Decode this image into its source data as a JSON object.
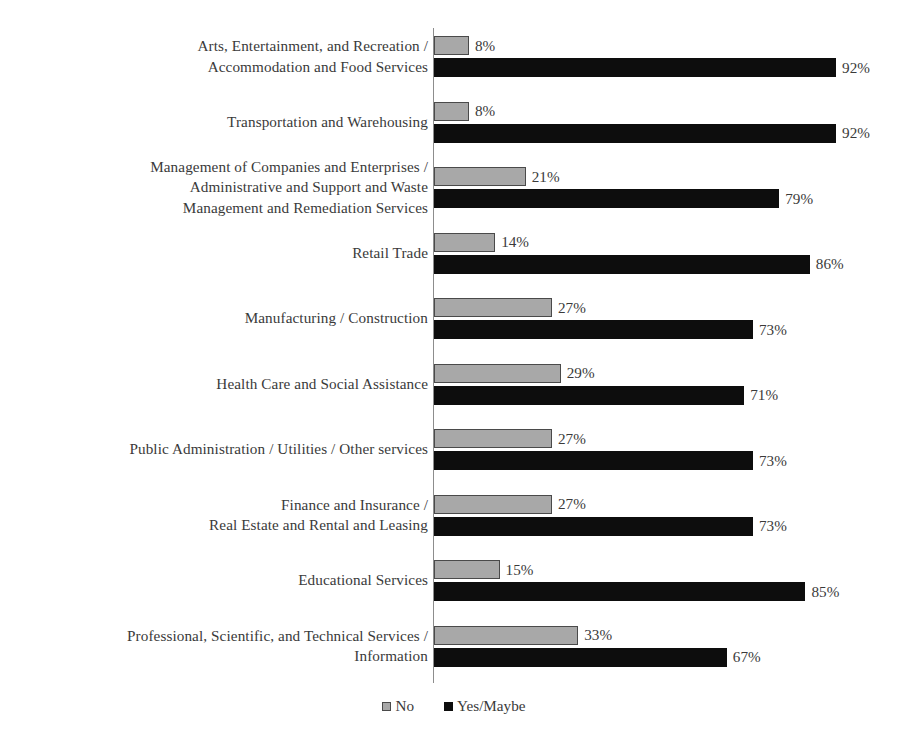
{
  "chart_data": {
    "type": "bar",
    "orientation": "horizontal",
    "title": "",
    "xlabel": "",
    "ylabel": "",
    "xlim": [
      0,
      100
    ],
    "grid": false,
    "legend_position": "bottom-center",
    "value_suffix": "%",
    "categories": [
      "Arts, Entertainment, and Recreation /\nAccommodation and Food Services",
      "Transportation and Warehousing",
      "Management of Companies and Enterprises /\nAdministrative and Support and Waste\nManagement and Remediation Services",
      "Retail Trade",
      "Manufacturing / Construction",
      "Health Care and Social Assistance",
      "Public Administration / Utilities / Other services",
      "Finance and Insurance /\nReal Estate and Rental and Leasing",
      "Educational Services",
      "Professional, Scientific, and Technical Services /\nInformation"
    ],
    "series": [
      {
        "name": "No",
        "color": "#a8a8a8",
        "values": [
          8,
          8,
          21,
          14,
          27,
          29,
          27,
          27,
          15,
          33
        ],
        "labels": [
          "8%",
          "8%",
          "21%",
          "14%",
          "27%",
          "29%",
          "27%",
          "27%",
          "15%",
          "33%"
        ]
      },
      {
        "name": "Yes/Maybe",
        "color": "#0d0d0d",
        "values": [
          92,
          92,
          79,
          86,
          73,
          71,
          73,
          73,
          85,
          67
        ],
        "labels": [
          "92%",
          "92%",
          "79%",
          "86%",
          "73%",
          "71%",
          "73%",
          "73%",
          "85%",
          "67%"
        ]
      }
    ]
  },
  "legend": {
    "items": [
      {
        "label": "No",
        "swatch": "gray-square-swatch"
      },
      {
        "label": "Yes/Maybe",
        "swatch": "black-square-swatch"
      }
    ]
  }
}
